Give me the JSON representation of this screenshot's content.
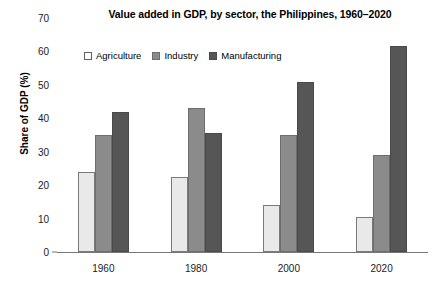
{
  "chart_data": {
    "type": "bar",
    "title": "Value added in GDP, by sector, the Philippines, 1960–2020",
    "xlabel": "",
    "ylabel": "Share of GDP (%)",
    "categories": [
      "1960",
      "1980",
      "2000",
      "2020"
    ],
    "ylim": [
      0,
      70
    ],
    "yticks": [
      0,
      10,
      20,
      30,
      40,
      50,
      60,
      70
    ],
    "ytick_labels": [
      "0",
      "10",
      "20",
      "30",
      "40",
      "50",
      "60",
      "70"
    ],
    "grid": false,
    "legend_position": "upper-left-inside",
    "series": [
      {
        "name": "Agriculture",
        "color": "#e9e9e9",
        "values": [
          24,
          22.5,
          14,
          10.5
        ]
      },
      {
        "name": "Industry",
        "color": "#8b8b8b",
        "values": [
          35,
          43,
          35,
          29
        ]
      },
      {
        "name": "Manufacturing",
        "color": "#565656",
        "values": [
          42,
          35.5,
          51,
          61.5
        ]
      }
    ]
  }
}
